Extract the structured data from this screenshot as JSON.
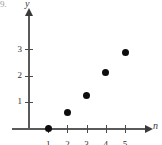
{
  "figure": {
    "problem_number": "9.",
    "axis_x_name": "n",
    "axis_y_name": "y"
  },
  "chart_data": {
    "type": "scatter",
    "title": "",
    "xlabel": "n",
    "ylabel": "y",
    "x": [
      1,
      2,
      3,
      4,
      5
    ],
    "values": [
      0,
      0.6,
      1.25,
      2.1,
      2.9
    ],
    "points": [
      {
        "n": 1,
        "y": 0
      },
      {
        "n": 2,
        "y": 0.6
      },
      {
        "n": 3,
        "y": 1.25
      },
      {
        "n": 4,
        "y": 2.1
      },
      {
        "n": 5,
        "y": 2.9
      }
    ],
    "xticks": [
      1,
      2,
      3,
      4,
      5
    ],
    "xtick_labels": [
      "1",
      "2",
      "3",
      "4",
      "5"
    ],
    "yticks": [
      1,
      2,
      3
    ],
    "ytick_labels": [
      "1",
      "2",
      "3"
    ],
    "xlim": [
      0,
      6
    ],
    "ylim": [
      0,
      3.6
    ],
    "grid": false,
    "legend": null,
    "marker": "filled-circle",
    "marker_color": "#0d0d0d",
    "axis_color": "#5a5a5a"
  }
}
